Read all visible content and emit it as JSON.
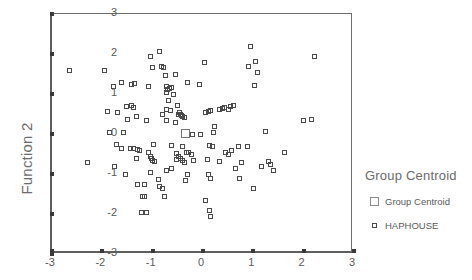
{
  "chart_data": {
    "type": "scatter",
    "title": "",
    "xlabel": "",
    "ylabel": "Function 2",
    "xlim": [
      -3,
      3
    ],
    "ylim": [
      -3,
      3
    ],
    "xticks": [
      "-3",
      "-2",
      "-1",
      "0",
      "1",
      "2",
      "3"
    ],
    "xtick_values": [
      -3,
      -2,
      -1,
      0,
      1,
      2,
      3
    ],
    "yticks": [
      "3",
      "2",
      "1",
      "0",
      "-1",
      "-2",
      "-3"
    ],
    "ytick_values": [
      3,
      2,
      1,
      0,
      -1,
      -2,
      -3
    ],
    "grid": false,
    "legend_position": "right",
    "legend_title": "Group Centroid",
    "series": [
      {
        "name": "Group Centroid",
        "marker": "open-square-large",
        "points": [
          [
            -0.35,
            0.02
          ]
        ]
      },
      {
        "name": "HAPHOUSE",
        "marker": "open-square-small",
        "points": [
          [
            -2.66,
            1.6
          ],
          [
            -1.95,
            1.6
          ],
          [
            -1.9,
            0.57
          ],
          [
            -2.3,
            -0.72
          ],
          [
            -1.77,
            1.18
          ],
          [
            -1.62,
            1.3
          ],
          [
            -1.72,
            -0.26
          ],
          [
            -1.7,
            0.55
          ],
          [
            -1.86,
            0.03
          ],
          [
            -1.75,
            -0.82
          ],
          [
            -1.52,
            0.69
          ],
          [
            -1.5,
            0.36
          ],
          [
            -1.42,
            1.23
          ],
          [
            -1.37,
            1.26
          ],
          [
            -1.43,
            0.72
          ],
          [
            -1.38,
            0.66
          ],
          [
            -1.32,
            0.44
          ],
          [
            -1.44,
            -0.36
          ],
          [
            -1.38,
            -0.36
          ],
          [
            -1.3,
            -0.38
          ],
          [
            -1.26,
            -0.41
          ],
          [
            -1.33,
            -0.62
          ],
          [
            -1.3,
            -1.26
          ],
          [
            -1.16,
            -1.25
          ],
          [
            -1.2,
            -1.55
          ],
          [
            -1.17,
            -1.56
          ],
          [
            -1.22,
            -1.95
          ],
          [
            -1.12,
            -1.95
          ],
          [
            -1.58,
            0.05
          ],
          [
            -1.62,
            -0.36
          ],
          [
            -1.53,
            -1.0
          ],
          [
            -1.05,
            1.93
          ],
          [
            -1.0,
            1.66
          ],
          [
            -1.08,
            1.2
          ],
          [
            -0.98,
            -0.25
          ],
          [
            -1.05,
            -0.55
          ],
          [
            -1.02,
            -0.62
          ],
          [
            -1.0,
            -0.66
          ],
          [
            -0.96,
            -0.68
          ],
          [
            -1.04,
            -0.95
          ],
          [
            -1.12,
            0.34
          ],
          [
            -1.08,
            -0.46
          ],
          [
            -0.87,
            2.07
          ],
          [
            -0.82,
            1.7
          ],
          [
            -0.78,
            1.66
          ],
          [
            -0.75,
            1.47
          ],
          [
            -0.72,
            1.2
          ],
          [
            -0.7,
            1.12
          ],
          [
            -0.66,
            1.15
          ],
          [
            -0.62,
            1.17
          ],
          [
            -0.58,
            1.0
          ],
          [
            -0.73,
            1.03
          ],
          [
            -0.68,
            0.85
          ],
          [
            -0.72,
            0.62
          ],
          [
            -0.65,
            0.6
          ],
          [
            -0.8,
            0.5
          ],
          [
            -0.58,
            0.98
          ],
          [
            -0.86,
            -1.3
          ],
          [
            -0.8,
            -1.37
          ],
          [
            -0.76,
            -1.55
          ],
          [
            -0.88,
            -1.13
          ],
          [
            -0.73,
            -0.9
          ],
          [
            -0.63,
            -0.85
          ],
          [
            -0.55,
            1.48
          ],
          [
            -0.5,
            0.72
          ],
          [
            -0.48,
            0.5
          ],
          [
            -0.45,
            0.49
          ],
          [
            -0.43,
            0.46
          ],
          [
            -0.4,
            0.44
          ],
          [
            -0.36,
            0.42
          ],
          [
            -0.47,
            0.55
          ],
          [
            -0.52,
            -0.48
          ],
          [
            -0.48,
            -0.56
          ],
          [
            -0.44,
            -0.62
          ],
          [
            -0.4,
            -0.66
          ],
          [
            -0.37,
            -0.7
          ],
          [
            -0.33,
            -0.47
          ],
          [
            -0.52,
            -0.64
          ],
          [
            -0.4,
            -0.3
          ],
          [
            -0.35,
            -1.17
          ],
          [
            -0.3,
            1.3
          ],
          [
            -0.28,
            -0.46
          ],
          [
            -0.22,
            -0.5
          ],
          [
            -0.18,
            -0.66
          ],
          [
            -0.3,
            -1.0
          ],
          [
            -0.2,
            0.0
          ],
          [
            -0.05,
            -0.02
          ],
          [
            -0.07,
            1.25
          ],
          [
            0.02,
            1.78
          ],
          [
            0.05,
            0.54
          ],
          [
            0.1,
            0.56
          ],
          [
            0.15,
            0.6
          ],
          [
            0.2,
            0.04
          ],
          [
            0.22,
            0.2
          ],
          [
            0.12,
            -0.28
          ],
          [
            0.18,
            -0.3
          ],
          [
            0.08,
            -0.64
          ],
          [
            0.1,
            -1.0
          ],
          [
            0.15,
            -1.1
          ],
          [
            0.05,
            -1.66
          ],
          [
            0.12,
            -1.92
          ],
          [
            0.14,
            -2.06
          ],
          [
            0.32,
            0.62
          ],
          [
            0.38,
            0.64
          ],
          [
            0.43,
            0.66
          ],
          [
            0.5,
            0.62
          ],
          [
            0.54,
            0.68
          ],
          [
            0.6,
            0.72
          ],
          [
            0.44,
            -0.45
          ],
          [
            0.5,
            -0.5
          ],
          [
            0.56,
            -0.42
          ],
          [
            0.65,
            -0.85
          ],
          [
            0.7,
            -0.3
          ],
          [
            0.76,
            -0.72
          ],
          [
            0.72,
            -1.12
          ],
          [
            0.95,
            2.2
          ],
          [
            0.9,
            1.68
          ],
          [
            1.05,
            1.82
          ],
          [
            1.02,
            1.22
          ],
          [
            1.08,
            1.55
          ],
          [
            0.88,
            -0.3
          ],
          [
            1.0,
            -1.35
          ],
          [
            1.16,
            -0.8
          ],
          [
            1.25,
            0.07
          ],
          [
            1.3,
            -0.68
          ],
          [
            1.35,
            -0.76
          ],
          [
            1.4,
            -0.9
          ],
          [
            1.62,
            -0.45
          ],
          [
            2.0,
            0.34
          ],
          [
            2.16,
            0.36
          ],
          [
            2.22,
            1.93
          ],
          [
            -0.55,
            0.28
          ],
          [
            -0.72,
            0.35
          ],
          [
            0.32,
            -0.68
          ],
          [
            -0.62,
            -0.28
          ]
        ]
      }
    ]
  },
  "legend": {
    "title": "Group Centroid",
    "entries": [
      {
        "label": "Group Centroid",
        "marker": "open-square-large"
      },
      {
        "label": "HAPHOUSE",
        "marker": "open-square-small"
      }
    ]
  },
  "axes": {
    "ylabel": "Function 2"
  }
}
